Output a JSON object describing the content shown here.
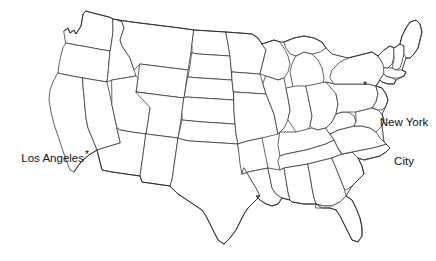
{
  "map": {
    "title": "United States state outline map",
    "background_color": "#ffffff",
    "state_border_color": "#3c3c3c",
    "outline_color": "#2a2a2a",
    "label_color": "#111111",
    "marker_glyph": "*",
    "cities": [
      {
        "name": "Los Angeles",
        "label_line_1": "Los Angeles",
        "label_line_2": "",
        "marker_x": 88,
        "marker_y": 155,
        "label_x": 14,
        "label_y": 152,
        "align": "right"
      },
      {
        "name": "New York City",
        "label_line_1": "New York",
        "label_line_2": "City",
        "marker_x": 366,
        "marker_y": 86,
        "label_x": 374,
        "label_y": 90,
        "align": "left"
      }
    ]
  }
}
